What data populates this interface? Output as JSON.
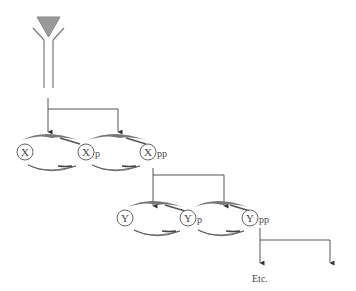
{
  "diagram": {
    "type": "signaling-cascade",
    "antibody": {
      "fill": "#9a9a9a",
      "stroke": "#777777"
    },
    "level1": {
      "node_letter": "X",
      "nodes": [
        {
          "label": "X",
          "suffix": ""
        },
        {
          "label": "X",
          "suffix": "p"
        },
        {
          "label": "X",
          "suffix": "pp"
        }
      ]
    },
    "level2": {
      "node_letter": "Y",
      "nodes": [
        {
          "label": "Y",
          "suffix": ""
        },
        {
          "label": "Y",
          "suffix": "p"
        },
        {
          "label": "Y",
          "suffix": "pp"
        }
      ]
    },
    "continuation_label": "Etc.",
    "colors": {
      "line": "#555555",
      "arrow_fill": "#777777",
      "arrow_dark": "#555555",
      "text": "#444444"
    }
  }
}
